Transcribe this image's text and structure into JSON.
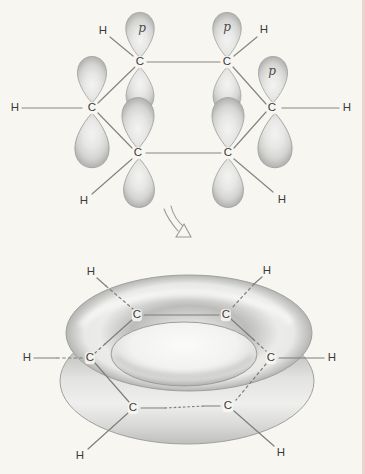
{
  "figure": {
    "background_color": "#f8f6f1",
    "page_edge_color": "#eccac4",
    "bond_line_color": "#858585",
    "atom_label_color": "#3b3b3b",
    "orbital_fill_light": "#ececea",
    "orbital_fill_dark": "#b4b4b2"
  },
  "top_diagram": {
    "name": "benzene-p-orbital-diagram",
    "carbons": [
      "C",
      "C",
      "C",
      "C",
      "C",
      "C"
    ],
    "hydrogens": [
      "H",
      "H",
      "H",
      "H",
      "H",
      "H"
    ],
    "p_labels": [
      "p",
      "p",
      "p"
    ]
  },
  "transform_arrow": {
    "name": "becomes-arrow",
    "meaning": "orbitals merge into pi clouds"
  },
  "bottom_diagram": {
    "name": "benzene-pi-cloud-diagram",
    "carbons": [
      "C",
      "C",
      "C",
      "C",
      "C",
      "C"
    ],
    "hydrogens": [
      "H",
      "H",
      "H",
      "H",
      "H",
      "H"
    ]
  }
}
